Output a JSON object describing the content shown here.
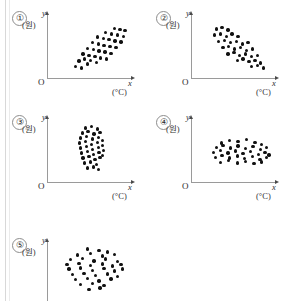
{
  "figure": {
    "kind": "multiple-choice-scatter-plots",
    "axis_labels": {
      "x_symbol": "x",
      "y_symbol": "y",
      "x_unit": "(°C)",
      "y_unit": "(원)",
      "origin": "O"
    },
    "options": [
      {
        "marker": "①",
        "label": "1"
      },
      {
        "marker": "②",
        "label": "2"
      },
      {
        "marker": "③",
        "label": "3"
      },
      {
        "marker": "④",
        "label": "4"
      },
      {
        "marker": "⑤",
        "label": "5"
      }
    ]
  },
  "chart_data": [
    {
      "type": "scatter",
      "title": "①",
      "xlabel": "x",
      "ylabel": "y",
      "xunit": "(°C)",
      "yunit": "(원)",
      "relationship": "strong positive correlation",
      "grid": false,
      "xlim": [
        0,
        100
      ],
      "ylim": [
        0,
        100
      ],
      "points": [
        [
          34,
          18
        ],
        [
          41,
          16
        ],
        [
          48,
          22
        ],
        [
          38,
          27
        ],
        [
          45,
          30
        ],
        [
          52,
          28
        ],
        [
          59,
          25
        ],
        [
          43,
          38
        ],
        [
          50,
          36
        ],
        [
          57,
          34
        ],
        [
          64,
          32
        ],
        [
          71,
          30
        ],
        [
          48,
          47
        ],
        [
          55,
          45
        ],
        [
          62,
          43
        ],
        [
          69,
          41
        ],
        [
          76,
          39
        ],
        [
          54,
          56
        ],
        [
          61,
          54
        ],
        [
          68,
          52
        ],
        [
          75,
          50
        ],
        [
          82,
          48
        ],
        [
          60,
          65
        ],
        [
          67,
          63
        ],
        [
          74,
          61
        ],
        [
          81,
          59
        ],
        [
          88,
          57
        ],
        [
          70,
          72
        ],
        [
          77,
          70
        ],
        [
          84,
          68
        ],
        [
          91,
          66
        ],
        [
          80,
          79
        ],
        [
          87,
          77
        ],
        [
          93,
          75
        ]
      ]
    },
    {
      "type": "scatter",
      "title": "②",
      "xlabel": "x",
      "ylabel": "y",
      "xunit": "(°C)",
      "yunit": "(원)",
      "relationship": "strong negative correlation",
      "grid": false,
      "xlim": [
        0,
        100
      ],
      "ylim": [
        0,
        100
      ],
      "points": [
        [
          30,
          78
        ],
        [
          37,
          80
        ],
        [
          44,
          76
        ],
        [
          28,
          68
        ],
        [
          35,
          70
        ],
        [
          42,
          66
        ],
        [
          49,
          70
        ],
        [
          56,
          66
        ],
        [
          33,
          58
        ],
        [
          40,
          60
        ],
        [
          47,
          56
        ],
        [
          54,
          58
        ],
        [
          61,
          54
        ],
        [
          68,
          56
        ],
        [
          38,
          48
        ],
        [
          45,
          50
        ],
        [
          52,
          46
        ],
        [
          59,
          48
        ],
        [
          66,
          44
        ],
        [
          73,
          46
        ],
        [
          44,
          38
        ],
        [
          51,
          40
        ],
        [
          58,
          36
        ],
        [
          65,
          38
        ],
        [
          72,
          34
        ],
        [
          79,
          36
        ],
        [
          55,
          28
        ],
        [
          62,
          30
        ],
        [
          69,
          26
        ],
        [
          76,
          28
        ],
        [
          83,
          24
        ],
        [
          72,
          18
        ],
        [
          79,
          20
        ],
        [
          86,
          16
        ]
      ]
    },
    {
      "type": "scatter",
      "title": "③",
      "xlabel": "x",
      "ylabel": "y",
      "xunit": "(°C)",
      "yunit": "(원)",
      "relationship": "no correlation, vertically elongated cluster",
      "grid": false,
      "xlim": [
        0,
        100
      ],
      "ylim": [
        0,
        100
      ],
      "points": [
        [
          46,
          86
        ],
        [
          53,
          88
        ],
        [
          60,
          84
        ],
        [
          42,
          78
        ],
        [
          49,
          80
        ],
        [
          56,
          76
        ],
        [
          63,
          79
        ],
        [
          40,
          70
        ],
        [
          47,
          72
        ],
        [
          54,
          68
        ],
        [
          61,
          71
        ],
        [
          66,
          66
        ],
        [
          39,
          62
        ],
        [
          46,
          64
        ],
        [
          53,
          60
        ],
        [
          60,
          63
        ],
        [
          66,
          58
        ],
        [
          40,
          54
        ],
        [
          47,
          56
        ],
        [
          54,
          52
        ],
        [
          61,
          55
        ],
        [
          67,
          50
        ],
        [
          41,
          46
        ],
        [
          48,
          48
        ],
        [
          55,
          44
        ],
        [
          62,
          47
        ],
        [
          66,
          42
        ],
        [
          43,
          38
        ],
        [
          50,
          40
        ],
        [
          57,
          36
        ],
        [
          63,
          39
        ],
        [
          45,
          30
        ],
        [
          52,
          32
        ],
        [
          59,
          28
        ],
        [
          48,
          22
        ],
        [
          55,
          24
        ],
        [
          61,
          20
        ]
      ]
    },
    {
      "type": "scatter",
      "title": "④",
      "xlabel": "x",
      "ylabel": "y",
      "xunit": "(°C)",
      "yunit": "(원)",
      "relationship": "no correlation, horizontally elongated cluster",
      "grid": false,
      "xlim": [
        0,
        100
      ],
      "ylim": [
        0,
        100
      ],
      "points": [
        [
          36,
          62
        ],
        [
          46,
          66
        ],
        [
          56,
          64
        ],
        [
          66,
          67
        ],
        [
          76,
          63
        ],
        [
          84,
          60
        ],
        [
          30,
          55
        ],
        [
          38,
          58
        ],
        [
          47,
          54
        ],
        [
          56,
          57
        ],
        [
          65,
          53
        ],
        [
          74,
          56
        ],
        [
          83,
          52
        ],
        [
          90,
          55
        ],
        [
          27,
          47
        ],
        [
          35,
          50
        ],
        [
          44,
          46
        ],
        [
          53,
          49
        ],
        [
          62,
          45
        ],
        [
          71,
          48
        ],
        [
          80,
          44
        ],
        [
          88,
          47
        ],
        [
          93,
          43
        ],
        [
          29,
          39
        ],
        [
          37,
          42
        ],
        [
          46,
          38
        ],
        [
          55,
          41
        ],
        [
          64,
          37
        ],
        [
          73,
          40
        ],
        [
          82,
          36
        ],
        [
          90,
          39
        ],
        [
          35,
          31
        ],
        [
          45,
          34
        ],
        [
          55,
          30
        ],
        [
          65,
          33
        ],
        [
          75,
          29
        ],
        [
          84,
          32
        ]
      ]
    },
    {
      "type": "scatter",
      "title": "⑤",
      "xlabel": "x",
      "ylabel": "y",
      "xunit": "(원)",
      "yunit": "(원)",
      "relationship": "no correlation, roughly circular random cluster",
      "grid": false,
      "xlim": [
        0,
        100
      ],
      "ylim": [
        0,
        100
      ],
      "points": [
        [
          48,
          88
        ],
        [
          62,
          86
        ],
        [
          72,
          83
        ],
        [
          36,
          78
        ],
        [
          52,
          80
        ],
        [
          66,
          76
        ],
        [
          80,
          79
        ],
        [
          28,
          70
        ],
        [
          42,
          72
        ],
        [
          56,
          68
        ],
        [
          70,
          71
        ],
        [
          84,
          67
        ],
        [
          24,
          62
        ],
        [
          38,
          64
        ],
        [
          52,
          60
        ],
        [
          66,
          63
        ],
        [
          78,
          59
        ],
        [
          88,
          62
        ],
        [
          26,
          54
        ],
        [
          40,
          56
        ],
        [
          54,
          52
        ],
        [
          68,
          55
        ],
        [
          80,
          51
        ],
        [
          90,
          54
        ],
        [
          30,
          45
        ],
        [
          44,
          47
        ],
        [
          58,
          43
        ],
        [
          72,
          46
        ],
        [
          84,
          42
        ],
        [
          34,
          36
        ],
        [
          48,
          38
        ],
        [
          62,
          34
        ],
        [
          76,
          37
        ],
        [
          40,
          28
        ],
        [
          54,
          30
        ],
        [
          68,
          26
        ],
        [
          50,
          20
        ],
        [
          63,
          22
        ]
      ]
    }
  ]
}
